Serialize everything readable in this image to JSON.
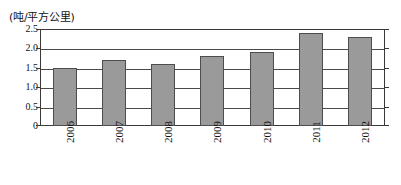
{
  "chart_data": {
    "type": "bar",
    "title": "",
    "subtitle": "",
    "unit_caption": "(吨/平方公里)",
    "xlabel": "",
    "ylabel": "",
    "categories": [
      "2006",
      "2007",
      "2008",
      "2009",
      "2010",
      "2011",
      "2012"
    ],
    "values": [
      1.5,
      1.7,
      1.6,
      1.8,
      1.9,
      2.4,
      2.3
    ],
    "series": [
      {
        "name": "吨/平方公里",
        "values": [
          1.5,
          1.7,
          1.6,
          1.8,
          1.9,
          2.4,
          2.3
        ]
      }
    ],
    "ylim": [
      0,
      2.5
    ],
    "ytick_values": [
      2.5,
      2.0,
      1.5,
      1.0,
      0.5,
      0
    ],
    "ytick_labels": [
      "2.5",
      "2.0",
      "1.5",
      "1.0",
      "0.5",
      "0"
    ],
    "grid": true,
    "grid_axis": "y",
    "legend": false,
    "legend_position": "none",
    "xtick_rotation": -90,
    "bar_fill_color": "#9a9a9a",
    "bar_border_color": "#4d4d4d",
    "axis_color": "#3a3a3a",
    "grid_color": "#4a4a4a",
    "background_color": "#ffffff"
  }
}
